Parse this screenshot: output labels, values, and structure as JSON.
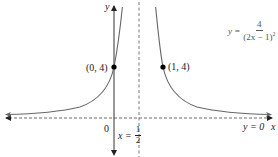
{
  "figure": {
    "equation": {
      "lhs": "y =",
      "numerator": "4",
      "denominator": "(2x − 1)",
      "exponent": "2"
    },
    "axis_labels": {
      "x": "x",
      "y": "y"
    },
    "origin_label": "0",
    "vertical_asymptote": {
      "lhs": "x =",
      "numerator": "1",
      "denominator": "2"
    },
    "horizontal_asymptote_label": "y = 0",
    "points": [
      {
        "label": "(0, 4)",
        "x": 0,
        "y": 4
      },
      {
        "label": "(1, 4)",
        "x": 1,
        "y": 4
      }
    ],
    "colors": {
      "curve": "#555555",
      "axes": "#333333",
      "asymptote": "#666666",
      "point": "#000000"
    }
  }
}
